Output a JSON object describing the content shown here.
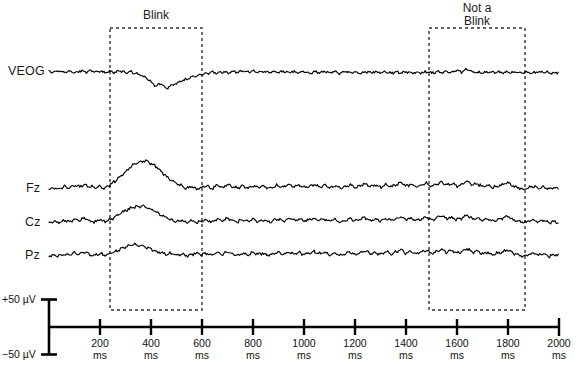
{
  "figure": {
    "channels": [
      {
        "name": "VEOG",
        "label": "VEOG",
        "baseline_y": 73
      },
      {
        "name": "Fz",
        "label": "Fz",
        "baseline_y": 190
      },
      {
        "name": "Cz",
        "label": "Cz",
        "baseline_y": 224
      },
      {
        "name": "Pz",
        "label": "Pz",
        "baseline_y": 257
      }
    ],
    "annotations": [
      {
        "name": "blink-box",
        "label": "Blink",
        "lines": [
          "Blink"
        ],
        "x_start_ms": 200,
        "x_end_ms": 400
      },
      {
        "name": "not-a-blink-box",
        "label": "Not a Blink",
        "lines": [
          "Not a",
          "Blink"
        ],
        "x_start_ms": 1500,
        "x_end_ms": 1875
      }
    ],
    "scale_bar": {
      "top_label": "+50 µV",
      "bottom_label": "−50 µV",
      "top_value": 50,
      "bottom_value": -50,
      "unit": "µV"
    },
    "axis": {
      "unit": "ms",
      "min_ms": 0,
      "max_ms": 2000,
      "tick_interval_ms": 200,
      "ticks": [
        {
          "value": "200",
          "unit": "ms"
        },
        {
          "value": "400",
          "unit": "ms"
        },
        {
          "value": "600",
          "unit": "ms"
        },
        {
          "value": "800",
          "unit": "ms"
        },
        {
          "value": "1000",
          "unit": "ms"
        },
        {
          "value": "1200",
          "unit": "ms"
        },
        {
          "value": "1400",
          "unit": "ms"
        },
        {
          "value": "1600",
          "unit": "ms"
        },
        {
          "value": "1800",
          "unit": "ms"
        },
        {
          "value": "2000",
          "unit": "ms"
        }
      ]
    },
    "colors": {
      "trace": "#000000",
      "axis": "#000000",
      "box": "#333333",
      "background": "#ffffff"
    }
  },
  "chart_data": {
    "type": "line",
    "title": "",
    "xlabel": "ms",
    "ylabel": "µV",
    "xlim": [
      0,
      2000
    ],
    "ylim": [
      -50,
      50
    ],
    "grid": false,
    "legend": "none",
    "x_tick_labels": [
      "200 ms",
      "400 ms",
      "600 ms",
      "800 ms",
      "1000 ms",
      "1200 ms",
      "1400 ms",
      "1600 ms",
      "1800 ms",
      "2000 ms"
    ],
    "annotations": [
      {
        "text": "Blink",
        "x_range_ms": [
          200,
          400
        ],
        "style": "dashed-box"
      },
      {
        "text": "Not a Blink",
        "x_range_ms": [
          1500,
          1875
        ],
        "style": "dashed-box"
      }
    ],
    "series": [
      {
        "name": "VEOG",
        "comment": "Vertical EOG; large negative-going blink deflection near 300-360 ms",
        "x": [
          0,
          20,
          40,
          60,
          80,
          100,
          120,
          140,
          160,
          180,
          200,
          220,
          240,
          260,
          280,
          300,
          320,
          340,
          360,
          380,
          400,
          420,
          440,
          460,
          480,
          500,
          520,
          540,
          560,
          580,
          600,
          620,
          640,
          660,
          680,
          700,
          720,
          740,
          760,
          780,
          800,
          820,
          840,
          860,
          880,
          900,
          920,
          940,
          960,
          980,
          1000,
          1020,
          1040,
          1060,
          1080,
          1100,
          1120,
          1140,
          1160,
          1180,
          1200,
          1220,
          1240,
          1260,
          1280,
          1300,
          1320,
          1340,
          1360,
          1380,
          1400,
          1420,
          1440,
          1460,
          1480,
          1500,
          1520,
          1540,
          1560,
          1580,
          1600,
          1620,
          1640,
          1660,
          1680,
          1700,
          1720,
          1740,
          1760,
          1780,
          1800,
          1820,
          1840,
          1860,
          1880,
          1900,
          1920,
          1940,
          1960,
          1980,
          2000
        ],
        "y": [
          6,
          2,
          7,
          1,
          5,
          0,
          6,
          2,
          8,
          3,
          6,
          1,
          5,
          2,
          6,
          0,
          4,
          -2,
          -6,
          -14,
          -26,
          -38,
          -30,
          -44,
          -36,
          -30,
          -24,
          -18,
          -12,
          -8,
          -4,
          -1,
          2,
          -1,
          3,
          0,
          4,
          1,
          5,
          2,
          6,
          2,
          5,
          1,
          4,
          1,
          5,
          2,
          4,
          1,
          4,
          0,
          3,
          1,
          4,
          1,
          3,
          0,
          4,
          1,
          3,
          0,
          3,
          1,
          4,
          1,
          3,
          0,
          3,
          1,
          3,
          0,
          2,
          1,
          3,
          0,
          3,
          1,
          4,
          2,
          6,
          3,
          12,
          4,
          2,
          0,
          2,
          1,
          3,
          0,
          2,
          1,
          3,
          1,
          2,
          0,
          3,
          1,
          2,
          0,
          2
        ]
      },
      {
        "name": "Fz",
        "comment": "Frontal channel; large positive blink artifact peak near 380 ms",
        "x": [
          0,
          20,
          40,
          60,
          80,
          100,
          120,
          140,
          160,
          180,
          200,
          220,
          240,
          260,
          280,
          300,
          320,
          340,
          360,
          380,
          400,
          420,
          440,
          460,
          480,
          500,
          520,
          540,
          560,
          580,
          600,
          620,
          640,
          660,
          680,
          700,
          720,
          740,
          760,
          780,
          800,
          820,
          840,
          860,
          880,
          900,
          920,
          940,
          960,
          980,
          1000,
          1020,
          1040,
          1060,
          1080,
          1100,
          1120,
          1140,
          1160,
          1180,
          1200,
          1220,
          1240,
          1260,
          1280,
          1300,
          1320,
          1340,
          1360,
          1380,
          1400,
          1420,
          1440,
          1460,
          1480,
          1500,
          1520,
          1540,
          1560,
          1580,
          1600,
          1620,
          1640,
          1660,
          1680,
          1700,
          1720,
          1740,
          1760,
          1780,
          1800,
          1820,
          1840,
          1860,
          1880,
          1900,
          1920,
          1940,
          1960,
          1980,
          2000
        ],
        "y": [
          2,
          5,
          3,
          8,
          5,
          12,
          8,
          14,
          9,
          6,
          10,
          4,
          14,
          22,
          34,
          46,
          58,
          66,
          70,
          72,
          66,
          58,
          46,
          34,
          24,
          16,
          10,
          4,
          8,
          2,
          6,
          10,
          4,
          12,
          6,
          14,
          8,
          4,
          10,
          5,
          12,
          6,
          10,
          4,
          8,
          12,
          6,
          14,
          8,
          12,
          6,
          10,
          14,
          8,
          12,
          6,
          10,
          4,
          8,
          14,
          6,
          10,
          16,
          8,
          12,
          6,
          14,
          8,
          12,
          18,
          10,
          14,
          8,
          12,
          16,
          10,
          14,
          20,
          12,
          16,
          10,
          14,
          22,
          12,
          16,
          8,
          12,
          6,
          10,
          14,
          18,
          10,
          6,
          2,
          6,
          10,
          4,
          8,
          2,
          6,
          3
        ]
      },
      {
        "name": "Cz",
        "comment": "Central channel; moderate positive blink artifact near 380 ms",
        "x": [
          0,
          20,
          40,
          60,
          80,
          100,
          120,
          140,
          160,
          180,
          200,
          220,
          240,
          260,
          280,
          300,
          320,
          340,
          360,
          380,
          400,
          420,
          440,
          460,
          480,
          500,
          520,
          540,
          560,
          580,
          600,
          620,
          640,
          660,
          680,
          700,
          720,
          740,
          760,
          780,
          800,
          820,
          840,
          860,
          880,
          900,
          920,
          940,
          960,
          980,
          1000,
          1020,
          1040,
          1060,
          1080,
          1100,
          1120,
          1140,
          1160,
          1180,
          1200,
          1220,
          1240,
          1260,
          1280,
          1300,
          1320,
          1340,
          1360,
          1380,
          1400,
          1420,
          1440,
          1460,
          1480,
          1500,
          1520,
          1540,
          1560,
          1580,
          1600,
          1620,
          1640,
          1660,
          1680,
          1700,
          1720,
          1740,
          1760,
          1780,
          1800,
          1820,
          1840,
          1860,
          1880,
          1900,
          1920,
          1940,
          1960,
          1980,
          2000
        ],
        "y": [
          3,
          6,
          4,
          9,
          6,
          13,
          9,
          15,
          8,
          5,
          11,
          5,
          12,
          18,
          26,
          34,
          40,
          44,
          46,
          44,
          38,
          30,
          22,
          16,
          10,
          6,
          10,
          4,
          8,
          3,
          7,
          11,
          5,
          13,
          7,
          15,
          9,
          5,
          11,
          6,
          13,
          7,
          11,
          5,
          9,
          13,
          7,
          15,
          9,
          13,
          7,
          11,
          15,
          9,
          13,
          7,
          11,
          5,
          9,
          15,
          7,
          11,
          17,
          9,
          13,
          7,
          15,
          9,
          13,
          19,
          11,
          15,
          9,
          13,
          17,
          11,
          15,
          21,
          13,
          17,
          11,
          15,
          23,
          13,
          17,
          9,
          13,
          7,
          11,
          15,
          19,
          11,
          7,
          3,
          7,
          11,
          5,
          9,
          3,
          7,
          4
        ]
      },
      {
        "name": "Pz",
        "comment": "Parietal channel; smallest positive blink artifact near 360 ms",
        "x": [
          0,
          20,
          40,
          60,
          80,
          100,
          120,
          140,
          160,
          180,
          200,
          220,
          240,
          260,
          280,
          300,
          320,
          340,
          360,
          380,
          400,
          420,
          440,
          460,
          480,
          500,
          520,
          540,
          560,
          580,
          600,
          620,
          640,
          660,
          680,
          700,
          720,
          740,
          760,
          780,
          800,
          820,
          840,
          860,
          880,
          900,
          920,
          940,
          960,
          980,
          1000,
          1020,
          1040,
          1060,
          1080,
          1100,
          1120,
          1140,
          1160,
          1180,
          1200,
          1220,
          1240,
          1260,
          1280,
          1300,
          1320,
          1340,
          1360,
          1380,
          1400,
          1420,
          1440,
          1460,
          1480,
          1500,
          1520,
          1540,
          1560,
          1580,
          1600,
          1620,
          1640,
          1660,
          1680,
          1700,
          1720,
          1740,
          1760,
          1780,
          1800,
          1820,
          1840,
          1860,
          1880,
          1900,
          1920,
          1940,
          1960,
          1980,
          2000
        ],
        "y": [
          2,
          5,
          3,
          8,
          4,
          11,
          7,
          13,
          7,
          4,
          9,
          4,
          10,
          14,
          20,
          26,
          30,
          32,
          30,
          26,
          20,
          14,
          10,
          6,
          10,
          4,
          8,
          3,
          7,
          11,
          5,
          9,
          4,
          12,
          6,
          14,
          8,
          4,
          10,
          5,
          12,
          6,
          10,
          4,
          8,
          12,
          6,
          14,
          8,
          12,
          6,
          10,
          14,
          8,
          12,
          6,
          10,
          4,
          8,
          14,
          6,
          10,
          16,
          8,
          12,
          6,
          14,
          8,
          12,
          18,
          10,
          14,
          8,
          12,
          16,
          10,
          14,
          20,
          12,
          16,
          10,
          14,
          22,
          12,
          16,
          8,
          12,
          6,
          10,
          14,
          18,
          10,
          6,
          2,
          6,
          10,
          4,
          8,
          2,
          6,
          3
        ]
      }
    ]
  }
}
